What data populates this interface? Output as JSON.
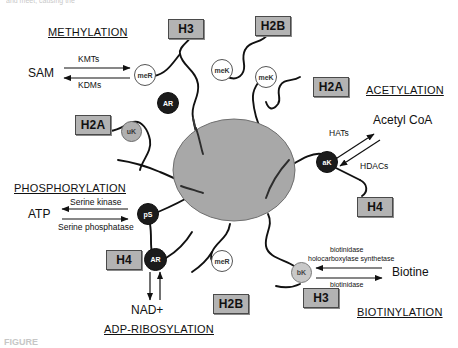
{
  "figure": {
    "partial_text_top": "and meet, causing the",
    "partial_text_bottom": "FIGURE",
    "core_label": "nucleosome-core"
  },
  "sections": [
    {
      "name": "methylation",
      "label": "METHYLATION"
    },
    {
      "name": "acetylation",
      "label": "ACETYLATION"
    },
    {
      "name": "phosphorylation",
      "label": "PHOSPHORYLATION"
    },
    {
      "name": "adp-ribosylation",
      "label": "ADP-RIBOSYLATION"
    },
    {
      "name": "biotinylation",
      "label": "BIOTINYLATION"
    }
  ],
  "histones": [
    {
      "id": "h3-top",
      "label": "H3"
    },
    {
      "id": "h2b-top",
      "label": "H2B"
    },
    {
      "id": "h2a-right",
      "label": "H2A"
    },
    {
      "id": "h2a-left",
      "label": "H2A"
    },
    {
      "id": "h4-right",
      "label": "H4"
    },
    {
      "id": "h4-left",
      "label": "H4"
    },
    {
      "id": "h2b-bottom",
      "label": "H2B"
    },
    {
      "id": "h3-bottom",
      "label": "H3"
    }
  ],
  "markers": [
    {
      "id": "meR-top",
      "label": "meR",
      "style": "white"
    },
    {
      "id": "AR-top",
      "label": "AR",
      "style": "dark"
    },
    {
      "id": "meK-top",
      "label": "meK",
      "style": "white"
    },
    {
      "id": "meK-right",
      "label": "meK",
      "style": "white"
    },
    {
      "id": "uK-left",
      "label": "uK",
      "style": "gray"
    },
    {
      "id": "aK-right",
      "label": "aK",
      "style": "dark"
    },
    {
      "id": "pS-left",
      "label": "pS",
      "style": "dark"
    },
    {
      "id": "AR-bottom",
      "label": "AR",
      "style": "dark"
    },
    {
      "id": "meR-bottom",
      "label": "meR",
      "style": "white"
    },
    {
      "id": "bK-right",
      "label": "bK",
      "style": "lgray"
    }
  ],
  "reactions": {
    "methylation": {
      "substrate": "SAM",
      "forward_enzyme": "KMTs",
      "reverse_enzyme": "KDMs"
    },
    "acetylation": {
      "substrate": "Acetyl CoA",
      "forward_enzyme": "HATs",
      "reverse_enzyme": "HDACs"
    },
    "phosphorylation": {
      "substrate": "ATP",
      "forward_enzyme": "Serine kinase",
      "reverse_enzyme": "Serine phosphatase"
    },
    "adp_ribosylation": {
      "substrate": "NAD+"
    },
    "biotinylation": {
      "substrate": "Biotine",
      "forward_enzyme_line1": "biotinidase",
      "forward_enzyme_line2": "holocarboxylase synthetase",
      "reverse_enzyme": "biotinidase"
    }
  },
  "colors": {
    "core_fill": "#a8a8a8",
    "core_stroke": "#6f6f6f",
    "box_fill": "#b3b3b3",
    "box_stroke": "#4a4a4a",
    "tail_stroke": "#111111"
  }
}
